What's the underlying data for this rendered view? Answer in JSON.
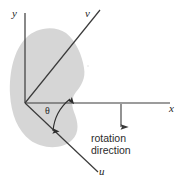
{
  "figure": {
    "type": "coordinate-rotation-diagram",
    "background_color": "#ffffff",
    "line_color": "#3a3a3a",
    "region_fill_color": "#d6d6d6",
    "axes": {
      "y": {
        "label": "y",
        "description": "vertical reference axis"
      },
      "x": {
        "label": "x",
        "description": "horizontal reference axis"
      },
      "v": {
        "label": "v",
        "description": "rotated axis, counterclockwise from x"
      },
      "u": {
        "label": "u",
        "description": "rotated axis, clockwise from x"
      }
    },
    "angle": {
      "label": "θ",
      "description": "angle between x axis and u axis"
    },
    "annotation": {
      "line1": "rotation",
      "line2": "direction"
    },
    "icons": {
      "rotation_arrow": "down-arrow-icon",
      "angle_arc_arrow": "double-headed-arc-arrow-icon"
    }
  }
}
